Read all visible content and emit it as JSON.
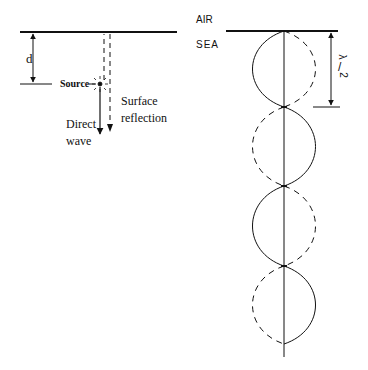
{
  "left_panel": {
    "depth_label": "d",
    "source_label": "Source",
    "direct_wave_label_line1": "Direct",
    "direct_wave_label_line2": "wave",
    "surface_reflection_label_line1": "Surface",
    "surface_reflection_label_line2": "reflection"
  },
  "right_panel": {
    "air_label": "AIR",
    "sea_label": "SEA",
    "half_wavelength_numerator": "λ",
    "half_wavelength_denominator": "2",
    "half_wavelength_label": "λ/2"
  },
  "colors": {
    "line": "#111111",
    "background": "#ffffff"
  }
}
